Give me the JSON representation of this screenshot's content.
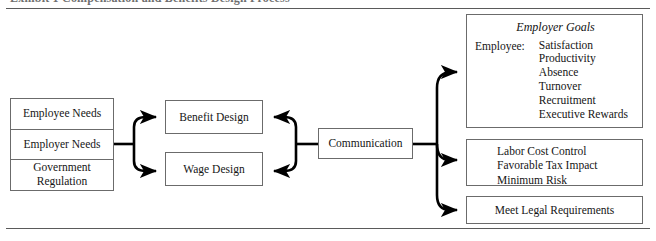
{
  "figure": {
    "caption_ghost": "Exhibit 1   Compensation and Benefits Design Process",
    "line_color": "#5a5a5a",
    "box_border_color": "#6b6b6b",
    "text_color": "#151515"
  },
  "inputs": {
    "items": [
      {
        "label": "Employee Needs"
      },
      {
        "label": "Employer Needs"
      },
      {
        "label": "Government\nRegulation"
      }
    ]
  },
  "design": {
    "benefit": "Benefit Design",
    "wage": "Wage Design"
  },
  "communication": {
    "label": "Communication"
  },
  "outcomes": {
    "employer_goals": {
      "title": "Employer Goals",
      "group_label": "Employee:",
      "items": [
        "Satisfaction",
        "Productivity",
        "Absence",
        "Turnover",
        "Recruitment",
        "Executive Rewards"
      ]
    },
    "cost_goals": {
      "items": [
        "Labor Cost Control",
        "Favorable Tax Impact",
        "Minimum Risk"
      ]
    },
    "legal_goals": {
      "label": "Meet Legal Requirements"
    }
  },
  "connectors": {
    "inputs_to_design": "bracket-fan-right",
    "communication_to_design": "bracket-fan-left",
    "communication_to_outcomes": "bracket-fan-right"
  }
}
